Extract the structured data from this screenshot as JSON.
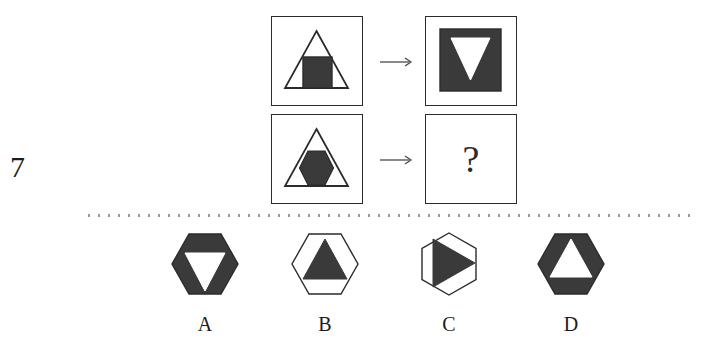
{
  "question": {
    "number": "7",
    "type": "visual-analogy-matrix",
    "unknown_marker": "?"
  },
  "colors": {
    "fill_dark": "#3a3a3a",
    "fill_light": "#ffffff",
    "stroke": "#2b2b2b",
    "text": "#1b1b1b",
    "separator": "#9a9a9a",
    "arrow": "#4a4a4a",
    "background": "#ffffff"
  },
  "matrix": {
    "arrow_glyph": "→",
    "rows": [
      {
        "row_id": "row-1",
        "source": {
          "panel_id": "panel-top-left",
          "outer_shape": "triangle",
          "outer_fill": "white",
          "inner_shape": "square",
          "inner_fill": "dark"
        },
        "relation": "arrow-right",
        "target": {
          "panel_id": "panel-top-right",
          "outer_shape": "square",
          "outer_fill": "dark",
          "inner_shape": "triangle-down",
          "inner_fill": "white"
        }
      },
      {
        "row_id": "row-2",
        "source": {
          "panel_id": "panel-bottom-left",
          "outer_shape": "triangle",
          "outer_fill": "white",
          "inner_shape": "hexagon",
          "inner_fill": "dark"
        },
        "relation": "arrow-right",
        "target": {
          "panel_id": "panel-bottom-right",
          "outer_shape": "unknown",
          "outer_fill": "unknown",
          "inner_shape": "unknown",
          "inner_fill": "unknown",
          "display": "?"
        }
      }
    ]
  },
  "options": [
    {
      "label": "A",
      "outer_shape": "hexagon",
      "outer_orientation": "flat-top",
      "outer_fill": "dark",
      "inner_shape": "triangle-down",
      "inner_fill": "white"
    },
    {
      "label": "B",
      "outer_shape": "hexagon",
      "outer_orientation": "flat-top",
      "outer_fill": "white",
      "inner_shape": "triangle-up",
      "inner_fill": "dark"
    },
    {
      "label": "C",
      "outer_shape": "hexagon",
      "outer_orientation": "pointy-top",
      "outer_fill": "white",
      "inner_shape": "triangle-right",
      "inner_fill": "dark"
    },
    {
      "label": "D",
      "outer_shape": "hexagon",
      "outer_orientation": "flat-top",
      "outer_fill": "dark",
      "inner_shape": "triangle-up",
      "inner_fill": "white"
    }
  ]
}
